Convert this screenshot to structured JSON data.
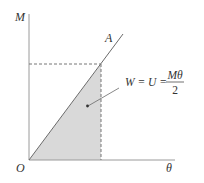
{
  "diagram": {
    "axes": {
      "y_label": "M",
      "x_label": "θ",
      "origin_label": "O"
    },
    "line": {
      "label": "A"
    },
    "annotation": {
      "lhs": "W = U =",
      "numerator": "Mθ",
      "denominator": "2"
    },
    "colors": {
      "axis": "#8a8a8a",
      "line": "#666666",
      "fill": "#d8d8d8",
      "dashed": "#777777",
      "text": "#333333"
    }
  }
}
